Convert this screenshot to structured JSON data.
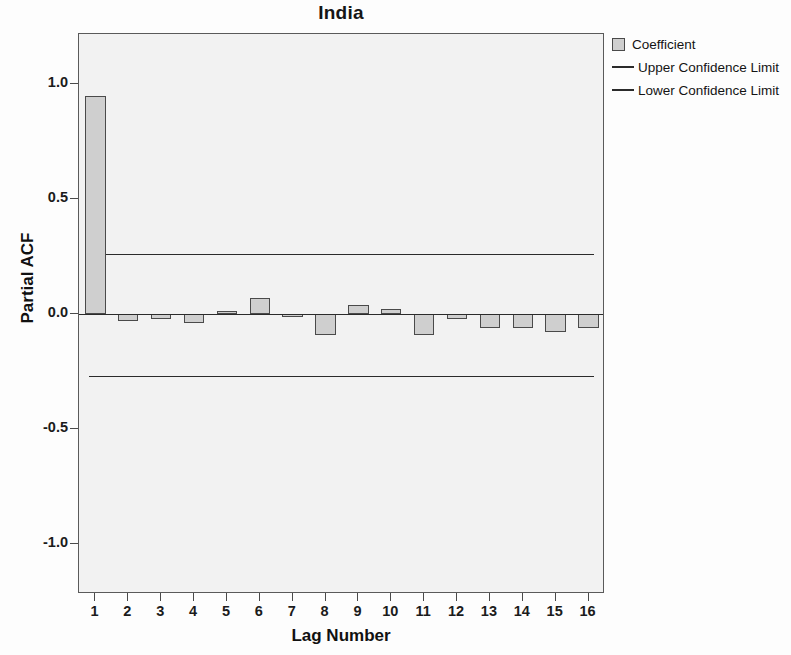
{
  "chart_data": {
    "type": "bar",
    "title": "India",
    "subtitle": "",
    "xlabel": "Lag Number",
    "ylabel": "Partial ACF",
    "categories": [
      "1",
      "2",
      "3",
      "4",
      "5",
      "6",
      "7",
      "8",
      "9",
      "10",
      "11",
      "12",
      "13",
      "14",
      "15",
      "16"
    ],
    "values": [
      0.95,
      -0.03,
      -0.02,
      -0.04,
      0.015,
      0.07,
      -0.01,
      -0.09,
      0.04,
      0.02,
      -0.09,
      -0.02,
      -0.06,
      -0.06,
      -0.08,
      -0.06
    ],
    "series": [
      {
        "name": "Coefficient",
        "values": [
          0.95,
          -0.03,
          -0.02,
          -0.04,
          0.015,
          0.07,
          -0.01,
          -0.09,
          0.04,
          0.02,
          -0.09,
          -0.02,
          -0.06,
          -0.06,
          -0.08,
          -0.06
        ]
      }
    ],
    "upper_confidence_limit": 0.26,
    "lower_confidence_limit": -0.27,
    "ylim": [
      -1.22,
      1.22
    ],
    "yticks": [
      1.0,
      0.5,
      0.0,
      -0.5,
      -1.0
    ],
    "ytick_labels": [
      "1.0",
      "0.5",
      "0.0",
      "-0.5",
      "-1.0"
    ],
    "xtick_labels": [
      "1",
      "2",
      "3",
      "4",
      "5",
      "6",
      "7",
      "8",
      "9",
      "10",
      "11",
      "12",
      "13",
      "14",
      "15",
      "16"
    ],
    "grid": false,
    "legend_position": "right",
    "colors": {
      "bar_fill": "#cfcfcf",
      "bar_border": "#4a4a4a",
      "line": "#2b2b2b",
      "plot_background": "#f2f2f2",
      "frame": "#5a5a5a"
    }
  },
  "legend": {
    "items": [
      {
        "label": "Coefficient",
        "marker": "square-swatch-icon"
      },
      {
        "label": "Upper Confidence Limit",
        "marker": "line-swatch-icon"
      },
      {
        "label": "Lower Confidence Limit",
        "marker": "line-swatch-icon"
      }
    ]
  }
}
